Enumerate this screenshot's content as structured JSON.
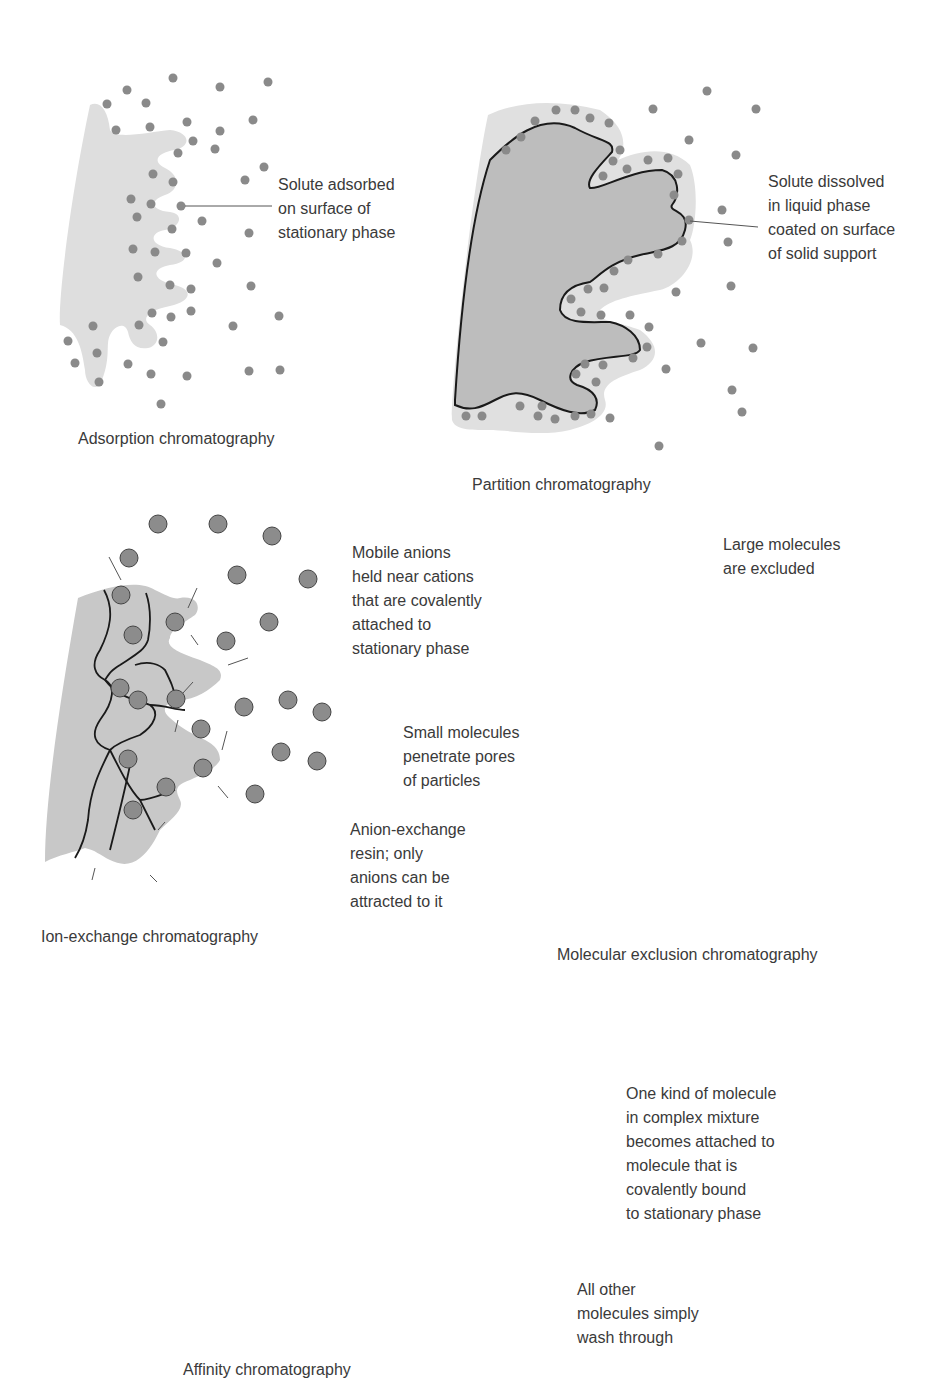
{
  "panels": {
    "adsorption": {
      "caption": "Adsorption chromatography",
      "callout": "Solute adsorbed\non surface of\nstationary phase"
    },
    "partition": {
      "caption": "Partition chromatography",
      "callout": "Solute dissolved\nin liquid phase\ncoated on surface\nof solid support"
    },
    "ion_exchange": {
      "caption": "Ion-exchange chromatography",
      "callout_top": "Mobile anions\nheld near cations\nthat are covalently\nattached to\nstationary phase",
      "callout_bottom": "Anion-exchange\nresin; only\nanions can be\nattracted to it",
      "cation_symbol": "+",
      "anion_symbol": "−"
    },
    "molecular_exclusion": {
      "caption": "Molecular exclusion chromatography",
      "callout_top": "Large molecules\nare excluded",
      "callout_left": "Small molecules\npenetrate pores\nof particles"
    },
    "affinity": {
      "caption": "Affinity chromatography",
      "callout_top": "One kind of molecule\nin complex mixture\nbecomes attached to\nmolecule that is\ncovalently bound\nto stationary phase",
      "callout_bottom": "All other\nmolecules simply\nwash through"
    }
  },
  "colors": {
    "stationary_light": "#dcdcdc",
    "stationary_mid": "#bdbdbd",
    "solute": "#8a8a8a",
    "anion": "#8c8c8c",
    "cation": "#e6e6e6",
    "molecule_dark": "#6e6e6e",
    "line": "#1a1a1a"
  }
}
